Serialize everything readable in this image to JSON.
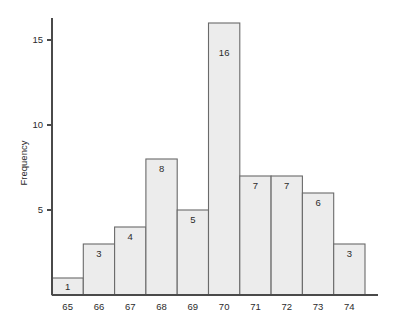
{
  "chart_data": {
    "type": "bar",
    "title": "",
    "subtitle": "",
    "xlabel": "",
    "ylabel": "Frequency",
    "categories": [
      "65",
      "66",
      "67",
      "68",
      "69",
      "70",
      "71",
      "72",
      "73",
      "74"
    ],
    "values": [
      1,
      3,
      4,
      8,
      5,
      16,
      7,
      7,
      6,
      3
    ],
    "bar_labels": [
      "1",
      "3",
      "4",
      "8",
      "5",
      "16",
      "7",
      "7",
      "6",
      "3"
    ],
    "ylim": [
      0,
      16.5
    ],
    "xlim": [
      64.5,
      74.5
    ],
    "yticks": [
      5,
      10,
      15
    ],
    "ytick_labels": [
      "5",
      "10",
      "15"
    ],
    "xtick_labels": [
      "65",
      "66",
      "67",
      "68",
      "69",
      "70",
      "71",
      "72",
      "73",
      "74"
    ],
    "grid": false,
    "legend": false,
    "legend_position": "none",
    "bar_fill_color": "#ececec",
    "bar_edge_color": "#6a6a6a",
    "axis_color": "#4a4a4a",
    "text_color": "#2b2b2b",
    "background_color": "#ffffff",
    "annotations": []
  }
}
